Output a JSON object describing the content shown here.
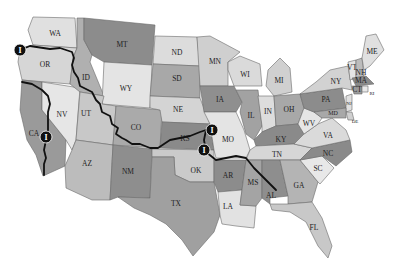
{
  "map": {
    "title": "United States route map",
    "colors": {
      "light": "#dcdcdc",
      "lighter": "#e8e8e8",
      "mid": "#b4b4b4",
      "dark": "#8e8e8e",
      "darker": "#7a7a7a",
      "route": "#111111",
      "marker": "#111111"
    },
    "states": [
      {
        "abbr": "WA"
      },
      {
        "abbr": "OR"
      },
      {
        "abbr": "CA"
      },
      {
        "abbr": "NV"
      },
      {
        "abbr": "ID"
      },
      {
        "abbr": "MT"
      },
      {
        "abbr": "WY"
      },
      {
        "abbr": "UT"
      },
      {
        "abbr": "AZ"
      },
      {
        "abbr": "CO"
      },
      {
        "abbr": "NM"
      },
      {
        "abbr": "ND"
      },
      {
        "abbr": "SD"
      },
      {
        "abbr": "NE"
      },
      {
        "abbr": "KS"
      },
      {
        "abbr": "OK"
      },
      {
        "abbr": "TX"
      },
      {
        "abbr": "MN"
      },
      {
        "abbr": "IA"
      },
      {
        "abbr": "MO"
      },
      {
        "abbr": "AR"
      },
      {
        "abbr": "LA"
      },
      {
        "abbr": "WI"
      },
      {
        "abbr": "IL"
      },
      {
        "abbr": "MI"
      },
      {
        "abbr": "IN"
      },
      {
        "abbr": "OH"
      },
      {
        "abbr": "KY"
      },
      {
        "abbr": "TN"
      },
      {
        "abbr": "MS"
      },
      {
        "abbr": "AL"
      },
      {
        "abbr": "GA"
      },
      {
        "abbr": "FL"
      },
      {
        "abbr": "SC"
      },
      {
        "abbr": "NC"
      },
      {
        "abbr": "VA"
      },
      {
        "abbr": "WV"
      },
      {
        "abbr": "PA"
      },
      {
        "abbr": "NY"
      },
      {
        "abbr": "VT"
      },
      {
        "abbr": "NH"
      },
      {
        "abbr": "ME"
      },
      {
        "abbr": "MA"
      },
      {
        "abbr": "CT"
      },
      {
        "abbr": "RI"
      },
      {
        "abbr": "NJ"
      },
      {
        "abbr": "DE"
      },
      {
        "abbr": "MD"
      }
    ],
    "markers": [
      {
        "id": "marker-oregon",
        "glyph": "I",
        "state": "OR"
      },
      {
        "id": "marker-california",
        "glyph": "I",
        "state": "CA"
      },
      {
        "id": "marker-kansas-east",
        "glyph": "I",
        "state": "KS"
      },
      {
        "id": "marker-kansas-south",
        "glyph": "I",
        "state": "OK"
      }
    ],
    "route": {
      "description": "Route from Oregon coast through ID, UT, CO, KS, OK, AR, MS to AL; branch from OR south through CA"
    }
  }
}
